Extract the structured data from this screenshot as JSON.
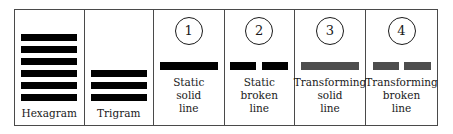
{
  "figure": {
    "name": "iching-line-types-legend",
    "border_color": "#4a4a4a",
    "background": "#ffffff"
  },
  "colors": {
    "static_line": "#000000",
    "transforming_line": "#4d4d4d",
    "text": "#1a1a1a",
    "border": "#4a4a4a"
  },
  "panels": [
    {
      "id": "hexagram",
      "badge": "",
      "caption": [
        "Hexagram"
      ],
      "glyph": {
        "kind": "stack",
        "rows": [
          {
            "type": "solid",
            "color": "#000000"
          },
          {
            "type": "solid",
            "color": "#000000"
          },
          {
            "type": "solid",
            "color": "#000000"
          },
          {
            "type": "solid",
            "color": "#000000"
          },
          {
            "type": "solid",
            "color": "#000000"
          },
          {
            "type": "solid",
            "color": "#000000"
          }
        ]
      }
    },
    {
      "id": "trigram",
      "badge": "",
      "caption": [
        "Trigram"
      ],
      "glyph": {
        "kind": "stack",
        "rows": [
          {
            "type": "solid",
            "color": "#000000"
          },
          {
            "type": "solid",
            "color": "#000000"
          },
          {
            "type": "solid",
            "color": "#000000"
          }
        ]
      }
    },
    {
      "id": "static-solid-line",
      "badge": "1",
      "caption": [
        "Static",
        "solid",
        "line"
      ],
      "glyph": {
        "kind": "single",
        "type": "solid",
        "color": "#000000"
      }
    },
    {
      "id": "static-broken-line",
      "badge": "2",
      "caption": [
        "Static",
        "broken",
        "line"
      ],
      "glyph": {
        "kind": "single",
        "type": "broken",
        "color": "#000000"
      }
    },
    {
      "id": "transforming-solid-line",
      "badge": "3",
      "caption": [
        "Transforming",
        "solid",
        "line"
      ],
      "glyph": {
        "kind": "single",
        "type": "solid",
        "color": "#4d4d4d"
      }
    },
    {
      "id": "transforming-broken-line",
      "badge": "4",
      "caption": [
        "Transforming",
        "broken",
        "line"
      ],
      "glyph": {
        "kind": "single",
        "type": "broken",
        "color": "#4d4d4d"
      }
    }
  ]
}
